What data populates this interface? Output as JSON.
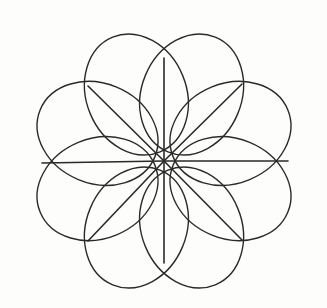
{
  "figure": {
    "background_color": "#fdfdfb",
    "stroke_color": "#2a2a2a",
    "petal_stroke_width": 1.4,
    "spoke_stroke_width": 1.6,
    "canvas": {
      "width": 327,
      "height": 308
    },
    "center": {
      "x": 164,
      "y": 161
    },
    "bounds": {
      "left": 19,
      "top": 22,
      "right": 314,
      "bottom": 303
    }
  },
  "chart_data": {
    "type": "scatter",
    "xlabel": "",
    "ylabel": "",
    "xlim": [
      0,
      327
    ],
    "ylim": [
      0,
      308
    ],
    "grid": false,
    "legend": "none",
    "center": {
      "x": 164,
      "y": 161
    },
    "petal_count": 8,
    "spoke_count": 8,
    "petal_semi_major": 62,
    "petal_semi_minor": 50,
    "petal_center_radius": 72,
    "petals": [
      {
        "index": 0,
        "name": "petal-n-nw",
        "angle_deg": 247.5,
        "cx": 136.4,
        "cy": 94.5,
        "rx": 62,
        "ry": 50,
        "rotation_deg": 247.5
      },
      {
        "index": 1,
        "name": "petal-n-ne",
        "angle_deg": 292.5,
        "cx": 191.6,
        "cy": 94.5,
        "rx": 62,
        "ry": 50,
        "rotation_deg": 292.5
      },
      {
        "index": 2,
        "name": "petal-e-ne",
        "angle_deg": 337.5,
        "cx": 230.5,
        "cy": 133.4,
        "rx": 62,
        "ry": 50,
        "rotation_deg": 337.5
      },
      {
        "index": 3,
        "name": "petal-e-se",
        "angle_deg": 22.5,
        "cx": 230.5,
        "cy": 188.6,
        "rx": 62,
        "ry": 50,
        "rotation_deg": 22.5
      },
      {
        "index": 4,
        "name": "petal-s-se",
        "angle_deg": 67.5,
        "cx": 191.6,
        "cy": 227.5,
        "rx": 62,
        "ry": 50,
        "rotation_deg": 67.5
      },
      {
        "index": 5,
        "name": "petal-s-sw",
        "angle_deg": 112.5,
        "cx": 136.4,
        "cy": 227.5,
        "rx": 62,
        "ry": 50,
        "rotation_deg": 112.5
      },
      {
        "index": 6,
        "name": "petal-w-sw",
        "angle_deg": 157.5,
        "cx": 97.5,
        "cy": 188.6,
        "rx": 62,
        "ry": 50,
        "rotation_deg": 157.5
      },
      {
        "index": 7,
        "name": "petal-w-nw",
        "angle_deg": 202.5,
        "cx": 97.5,
        "cy": 133.4,
        "rx": 62,
        "ry": 50,
        "rotation_deg": 202.5
      }
    ],
    "spokes": [
      {
        "index": 0,
        "name": "spoke-up",
        "angle_deg": 270,
        "x1": 164,
        "y1": 161,
        "x2": 164,
        "y2": 58
      },
      {
        "index": 1,
        "name": "spoke-upper-right",
        "angle_deg": 315,
        "x1": 164,
        "y1": 161,
        "x2": 242,
        "y2": 84
      },
      {
        "index": 2,
        "name": "spoke-right",
        "angle_deg": 0,
        "x1": 164,
        "y1": 161,
        "x2": 288,
        "y2": 161
      },
      {
        "index": 3,
        "name": "spoke-lower-right",
        "angle_deg": 45,
        "x1": 164,
        "y1": 161,
        "x2": 242,
        "y2": 240
      },
      {
        "index": 4,
        "name": "spoke-down",
        "angle_deg": 90,
        "x1": 164,
        "y1": 161,
        "x2": 164,
        "y2": 263
      },
      {
        "index": 5,
        "name": "spoke-lower-left",
        "angle_deg": 135,
        "x1": 164,
        "y1": 161,
        "x2": 88,
        "y2": 241
      },
      {
        "index": 6,
        "name": "spoke-left",
        "angle_deg": 180,
        "x1": 164,
        "y1": 161,
        "x2": 42,
        "y2": 163
      },
      {
        "index": 7,
        "name": "spoke-upper-left",
        "angle_deg": 225,
        "x1": 164,
        "y1": 161,
        "x2": 88,
        "y2": 86
      }
    ],
    "junction_points": [
      {
        "name": "junction-top",
        "x": 164,
        "y": 58
      },
      {
        "name": "junction-upper-right",
        "x": 242,
        "y": 84
      },
      {
        "name": "junction-right",
        "x": 288,
        "y": 161
      },
      {
        "name": "junction-lower-right",
        "x": 242,
        "y": 240
      },
      {
        "name": "junction-bottom",
        "x": 164,
        "y": 263
      },
      {
        "name": "junction-lower-left",
        "x": 88,
        "y": 241
      },
      {
        "name": "junction-left",
        "x": 42,
        "y": 163
      },
      {
        "name": "junction-upper-left",
        "x": 88,
        "y": 86
      }
    ]
  }
}
